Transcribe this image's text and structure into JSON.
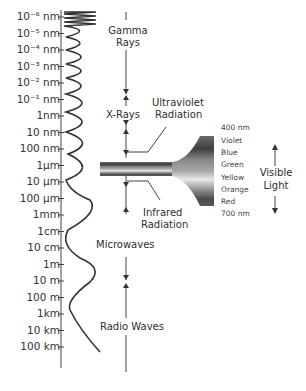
{
  "diagram": {
    "scale_ticks": [
      "10⁻⁶ nm",
      "10⁻⁵ nm",
      "10⁻⁴ nm",
      "10⁻³ nm",
      "10⁻² nm",
      "10⁻¹ nm",
      "1nm",
      "10 nm",
      "100 nm",
      "1µm",
      "10 µm",
      "100 µm",
      "1mm",
      "1cm",
      "10 cm",
      "1m",
      "10 m",
      "100 m",
      "1km",
      "10 km",
      "100 km"
    ],
    "regions": {
      "gamma": "Gamma",
      "gamma2": "Rays",
      "xrays": "X-Rays",
      "uv1": "Ultraviolet",
      "uv2": "Radiation",
      "ir1": "Infrared",
      "ir2": "Radiation",
      "microwaves": "Microwaves",
      "radio": "Radio Waves"
    },
    "visible": {
      "top": "400 nm",
      "colors": [
        "Violet",
        "Blue",
        "Green",
        "Yellow",
        "Orange",
        "Red"
      ],
      "bottom": "700 nm",
      "label1": "Visible",
      "label2": "Light"
    }
  }
}
